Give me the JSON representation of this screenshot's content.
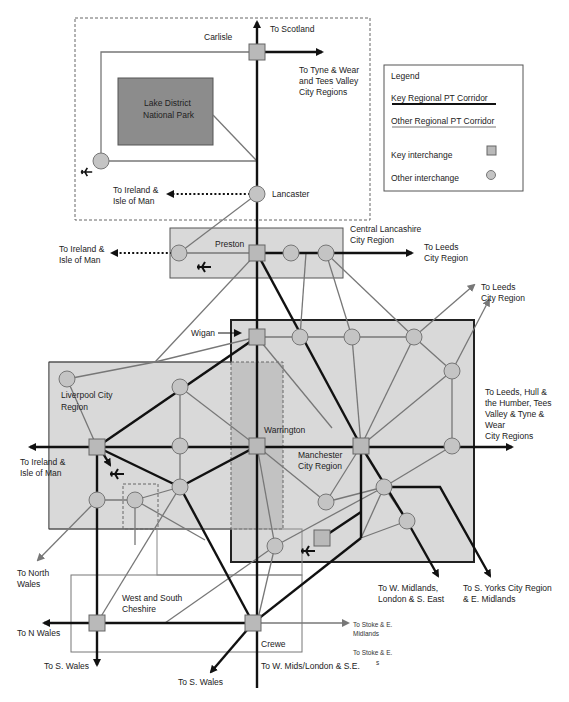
{
  "legend": {
    "title": "Legend",
    "key_corridor": "Key Regional PT Corridor",
    "other_corridor": "Other Regional PT Corridor",
    "key_interchange": "Key interchange",
    "other_interchange": "Other interchange"
  },
  "regions": {
    "lake_district": [
      "Lake District",
      "National Park"
    ],
    "central_lancashire": [
      "Central Lancashire",
      "City Region"
    ],
    "liverpool": [
      "Liverpool City",
      "Region"
    ],
    "manchester": [
      "Manchester",
      "City Region"
    ],
    "west_south_cheshire": [
      "West and South",
      "Cheshire"
    ]
  },
  "places": {
    "carlisle": "Carlisle",
    "lancaster": "Lancaster",
    "preston": "Preston",
    "wigan": "Wigan",
    "warrington": "Warrington",
    "crewe": "Crewe"
  },
  "destinations": {
    "scotland": "To Scotland",
    "tyne_wear_tees": [
      "To Tyne & Wear",
      "and Tees Valley",
      "City Regions"
    ],
    "ireland_lancaster": [
      "To Ireland &",
      "Isle of Man"
    ],
    "ireland_preston": [
      "To Ireland &",
      "Isle of Man"
    ],
    "leeds_preston": [
      "To Leeds",
      "City Region"
    ],
    "leeds_manchester": [
      "To Leeds",
      "City Region"
    ],
    "leeds_hull_tees_tyne": [
      "To Leeds, Hull &",
      "the Humber, Tees",
      "Valley &  Tyne &",
      "Wear",
      "City Regions"
    ],
    "ireland_liverpool": [
      "To Ireland &",
      "Isle of Man"
    ],
    "north_wales": [
      "To North",
      "Wales"
    ],
    "n_wales": "To N Wales",
    "s_wales_west": "To S. Wales",
    "s_wales_crewe": "To S. Wales",
    "w_mids_london_se_crewe": "To W. Mids/London & S.E.",
    "w_midlands_london_se": [
      "To W. Midlands,",
      "London & S. East"
    ],
    "s_yorks_e_midlands": [
      "To S. Yorks City Region",
      "& E. Midlands"
    ],
    "stoke_e_midlands_1": [
      "To Stoke & E.",
      "Midlands"
    ],
    "stoke_e_midlands_2": [
      "To Stoke & E.",
      "s"
    ]
  },
  "icons": {
    "airport": "airplane-icon",
    "key_interchange": "square",
    "other_interchange": "circle"
  },
  "colors": {
    "region_fill": "#d9d9d9",
    "lake_district_fill": "#8c8c8c",
    "warrington_band_fill": "#c2c2c2",
    "key_corridor": "#111111",
    "other_corridor": "#777777",
    "node_fill": "#c4c4c4"
  }
}
